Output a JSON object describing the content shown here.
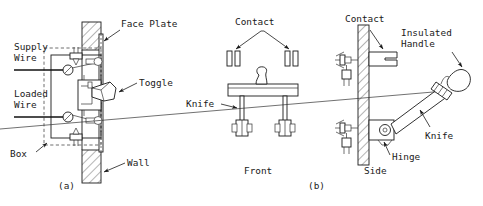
{
  "figure": {
    "background_color": "#ffffff",
    "line_color": "#1a1a1a",
    "panels": [
      {
        "id": "a",
        "caption": "(a)",
        "view": "toggle switch in wall box, cutaway",
        "labels": [
          "Supply Wire",
          "Loaded Wire",
          "Box",
          "Face Plate",
          "Toggle",
          "Wall"
        ]
      },
      {
        "id": "b",
        "caption": "(b)",
        "views": [
          "Front",
          "Side"
        ],
        "labels": [
          "Contact",
          "Knife",
          "Insulated Handle",
          "Hinge"
        ]
      }
    ]
  },
  "panel_a": {
    "caption": "(a)",
    "label_face_plate": "Face Plate",
    "label_supply_wire_line1": "Supply",
    "label_supply_wire_line2": "Wire",
    "label_loaded_wire_line1": "Loaded",
    "label_loaded_wire_line2": "Wire",
    "label_toggle": "Toggle",
    "label_box": "Box",
    "label_wall": "Wall"
  },
  "panel_b_front": {
    "caption": "Front",
    "label_contact": "Contact",
    "label_knife": "Knife"
  },
  "panel_b_side": {
    "caption": "Side",
    "panel_caption": "(b)",
    "label_contact": "Contact",
    "label_insulated_handle_line1": "Insulated",
    "label_insulated_handle_line2": "Handle",
    "label_knife": "Knife",
    "label_hinge": "Hinge"
  }
}
